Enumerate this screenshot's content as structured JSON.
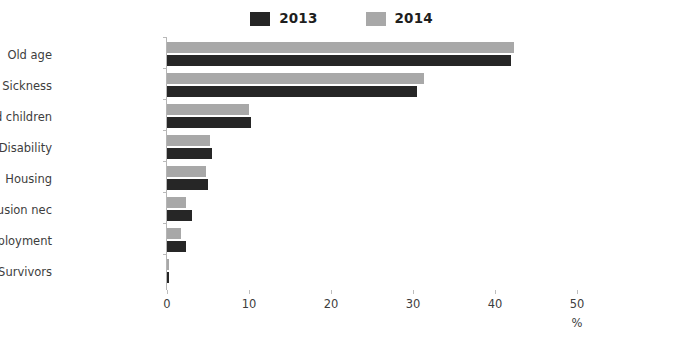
{
  "legend": {
    "position": "top-center",
    "entries": [
      {
        "label": "2013",
        "color": "#262626",
        "swatch_name": "legend-swatch-2013"
      },
      {
        "label": "2014",
        "color": "#a8a8a8",
        "swatch_name": "legend-swatch-2014"
      }
    ]
  },
  "axis": {
    "x_unit_label": "%",
    "x_ticks": [
      "0",
      "10",
      "20",
      "30",
      "40",
      "50"
    ]
  },
  "chart_data": {
    "type": "bar",
    "orientation": "horizontal",
    "title": "",
    "subtitle": "",
    "xlabel": "%",
    "ylabel": "",
    "xlim": [
      0,
      50
    ],
    "xticks": [
      0,
      10,
      20,
      30,
      40,
      50
    ],
    "grid": false,
    "legend_position": "top-center",
    "categories": [
      "Old age",
      "Sickness",
      "Family and children",
      "Disability",
      "Housing",
      "Social exclusion nec",
      "Unemployment",
      "Survivors"
    ],
    "series": [
      {
        "name": "2013",
        "color": "#262626",
        "values": [
          42.0,
          30.5,
          10.2,
          5.5,
          5.0,
          3.0,
          2.3,
          0.2
        ]
      },
      {
        "name": "2014",
        "color": "#a8a8a8",
        "values": [
          42.3,
          31.3,
          10.0,
          5.2,
          4.7,
          2.3,
          1.7,
          0.2
        ]
      }
    ]
  }
}
